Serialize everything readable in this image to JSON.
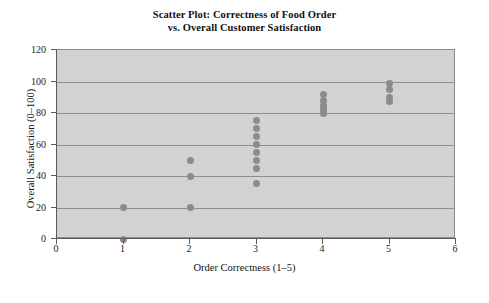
{
  "chart_data": {
    "type": "scatter",
    "title": "Scatter Plot: Correctness of Food Order vs. Overall Customer Satisfaction",
    "title_lines": [
      "Scatter Plot: Correctness of Food Order",
      "vs. Overall Customer Satisfaction"
    ],
    "xlabel": "Order Correctness (1–5)",
    "ylabel": "Overall Satisfaction (0–100)",
    "xlim": [
      0,
      6
    ],
    "ylim": [
      0,
      120
    ],
    "xticks": [
      0,
      1,
      2,
      3,
      4,
      5,
      6
    ],
    "yticks": [
      0,
      20,
      40,
      60,
      80,
      100,
      120
    ],
    "xtick_labels": [
      "0",
      "1",
      "2",
      "3",
      "4",
      "5",
      "6"
    ],
    "ytick_labels": [
      "0",
      "20",
      "40",
      "60",
      "80",
      "100",
      "120"
    ],
    "grid": "horizontal",
    "legend": "none",
    "marker_color": "#8b8b8b",
    "plot_background": "#d2d2d2",
    "gridline_color": "#8e8e8e",
    "points": [
      {
        "x": 1,
        "y": 20
      },
      {
        "x": 1,
        "y": 0
      },
      {
        "x": 2,
        "y": 50
      },
      {
        "x": 2,
        "y": 40
      },
      {
        "x": 2,
        "y": 20
      },
      {
        "x": 3,
        "y": 75
      },
      {
        "x": 3,
        "y": 70
      },
      {
        "x": 3,
        "y": 65
      },
      {
        "x": 3,
        "y": 60
      },
      {
        "x": 3,
        "y": 55
      },
      {
        "x": 3,
        "y": 50
      },
      {
        "x": 3,
        "y": 45
      },
      {
        "x": 3,
        "y": 35
      },
      {
        "x": 4,
        "y": 92
      },
      {
        "x": 4,
        "y": 88
      },
      {
        "x": 4,
        "y": 85
      },
      {
        "x": 4,
        "y": 82
      },
      {
        "x": 4,
        "y": 80
      },
      {
        "x": 5,
        "y": 99
      },
      {
        "x": 5,
        "y": 95
      },
      {
        "x": 5,
        "y": 90
      },
      {
        "x": 5,
        "y": 87
      }
    ]
  }
}
